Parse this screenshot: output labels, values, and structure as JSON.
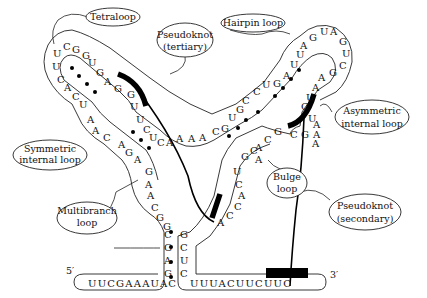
{
  "diagram": {
    "type": "RNA secondary structure",
    "ends": {
      "five_prime": "5′",
      "three_prime": "3′"
    },
    "labels": {
      "tetraloop": "Tetraloop",
      "hairpin_loop": "Hairpin loop",
      "pseudoknot_tertiary_1": "Pseudoknot",
      "pseudoknot_tertiary_2": "(tertiary)",
      "symmetric_1": "Symmetric",
      "symmetric_2": "internal loop",
      "asymmetric_1": "Asymmetric",
      "asymmetric_2": "internal loop",
      "bulge_1": "Bulge",
      "bulge_2": "loop",
      "multibranch_1": "Multibranch",
      "multibranch_2": "loop",
      "pseudoknot_secondary_1": "Pseudoknot",
      "pseudoknot_secondary_2": "(secondary)"
    },
    "sequences": {
      "five_prime_tail": "UUCGAAAUAC",
      "three_prime_tail": "UUUACUUCUUC",
      "left_stem_5p": [
        "C",
        "G",
        "A",
        "G"
      ],
      "left_stem_3p": [
        "G",
        "C",
        "U",
        "C"
      ],
      "multibranch_left": [
        "G",
        "A",
        "A",
        "C",
        "G",
        "G"
      ],
      "left_arm_outer": [
        "A",
        "G",
        "A",
        "C",
        "A",
        "A",
        "U",
        "C",
        "A",
        "C",
        "U",
        "U"
      ],
      "tetraloop": [
        "C",
        "G"
      ],
      "left_arm_inner": [
        "G",
        "U",
        "G",
        "A",
        "G",
        "G",
        "U",
        "U",
        "C",
        "U",
        "C"
      ],
      "junction": [
        "A",
        "A",
        "A",
        "A",
        "C"
      ],
      "right_arm_outer": [
        "G",
        "U",
        "G",
        "C",
        "C",
        "U",
        "G",
        "A",
        "U",
        "U",
        "A",
        "G"
      ],
      "hairpin_loop": [
        "U",
        "A",
        "G",
        "U",
        "C"
      ],
      "right_arm_inner": [
        "G",
        "A",
        "A",
        "U",
        "C",
        "U",
        "A",
        "A"
      ],
      "asymmetric_loop": [
        "C",
        "G",
        "A"
      ],
      "right_arm_lower": [
        "G",
        "C",
        "A",
        "G",
        "C",
        "A"
      ],
      "bulge_side": [
        "U",
        "C",
        "A",
        "C",
        "C",
        "A"
      ]
    },
    "colors": {
      "ink": "#111111",
      "pseudoknot": "#000000",
      "background": "#ffffff"
    }
  }
}
